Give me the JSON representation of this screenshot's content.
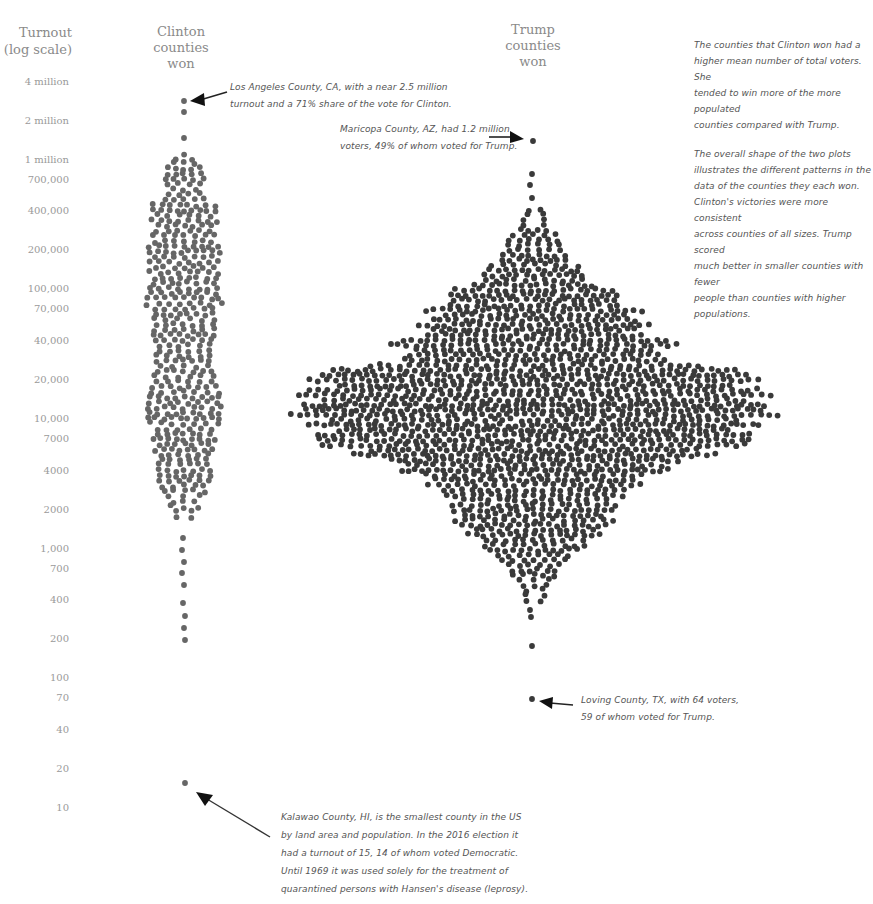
{
  "chart_data": {
    "type": "beeswarm",
    "title": "",
    "ylabel": "Turnout (log scale)",
    "yscale": "log",
    "ylim": [
      10,
      4000000
    ],
    "grid": false,
    "series": [
      {
        "name": "Clinton counties won",
        "color": "#666666",
        "notable_points": [
          {
            "label": "Los Angeles County, CA",
            "turnout": 2500000
          },
          {
            "label": "Kalawao County, HI",
            "turnout": 15
          }
        ],
        "approx_count": 490
      },
      {
        "name": "Trump counties won",
        "color": "#3a3a3a",
        "notable_points": [
          {
            "label": "Maricopa County, AZ",
            "turnout": 1200000
          },
          {
            "label": "Loving County, TX",
            "turnout": 64
          }
        ],
        "approx_count": 2620
      }
    ],
    "y_ticks": [
      {
        "label": "4 million",
        "value": 4000000
      },
      {
        "label": "2 million",
        "value": 2000000
      },
      {
        "label": "1 million",
        "value": 1000000
      },
      {
        "label": "700,000",
        "value": 700000
      },
      {
        "label": "400,000",
        "value": 400000
      },
      {
        "label": "200,000",
        "value": 200000
      },
      {
        "label": "100,000",
        "value": 100000
      },
      {
        "label": "70,000",
        "value": 70000
      },
      {
        "label": "40,000",
        "value": 40000
      },
      {
        "label": "20,000",
        "value": 20000
      },
      {
        "label": "10,000",
        "value": 10000
      },
      {
        "label": "7000",
        "value": 7000
      },
      {
        "label": "4000",
        "value": 4000
      },
      {
        "label": "2000",
        "value": 2000
      },
      {
        "label": "1,000",
        "value": 1000
      },
      {
        "label": "700",
        "value": 700
      },
      {
        "label": "400",
        "value": 400
      },
      {
        "label": "200",
        "value": 200
      },
      {
        "label": "100",
        "value": 100
      },
      {
        "label": "70",
        "value": 70
      },
      {
        "label": "40",
        "value": 40
      },
      {
        "label": "20",
        "value": 20
      },
      {
        "label": "10",
        "value": 10
      }
    ]
  },
  "axis": {
    "title_line1": "Turnout",
    "title_line2": "(log scale)"
  },
  "columns": {
    "clinton": {
      "line1": "Clinton",
      "line2": "counties",
      "line3": "won"
    },
    "trump": {
      "line1": "Trump",
      "line2": "counties",
      "line3": "won"
    }
  },
  "annotations": {
    "los_angeles": {
      "line1": "Los Angeles County, CA, with a near 2.5 million",
      "line2": "turnout and a 71% share of the vote for Clinton."
    },
    "maricopa": {
      "line1": "Maricopa County, AZ, had 1.2 million",
      "line2": "voters, 49% of whom voted for Trump."
    },
    "loving": {
      "line1": "Loving County, TX, with 64 voters,",
      "line2": "59 of whom voted for Trump."
    },
    "kalawao": {
      "line1": "Kalawao County, HI, is the smallest county in the US",
      "line2": "by land area and population. In the 2016 election it",
      "line3": "had a turnout of 15, 14 of whom voted Democratic.",
      "line4": "Until 1969 it was used solely for the treatment of",
      "line5": "quarantined persons with Hansen's disease (leprosy)."
    }
  },
  "commentary": {
    "para1": [
      "The counties that Clinton won had a",
      "higher mean number of total voters. She",
      "tended to win more of the more populated",
      "counties compared with Trump."
    ],
    "para2": [
      "The overall shape of the two plots",
      "illustrates the different patterns in the",
      "data of the counties they each won.",
      "Clinton's victories were more consistent",
      "across counties of all sizes. Trump scored",
      "much better in smaller counties with fewer",
      "people than counties with higher populations."
    ]
  }
}
